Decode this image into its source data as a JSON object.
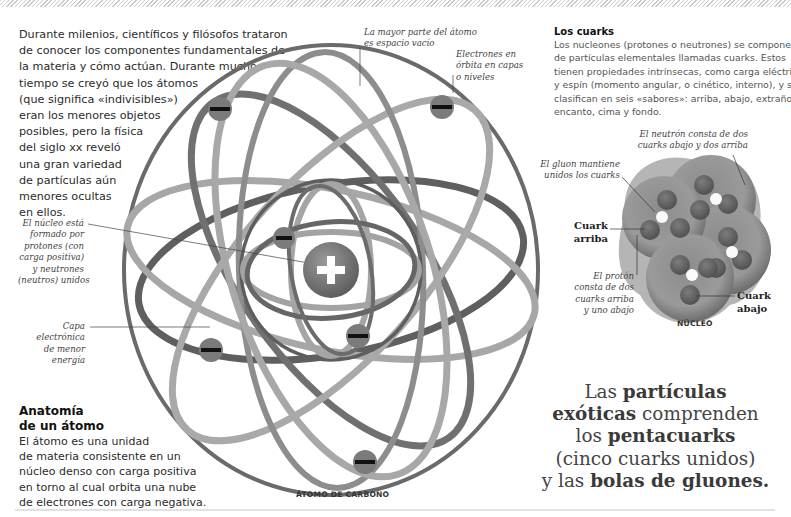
{
  "intro": {
    "lines": [
      "Durante milenios, científicos y filósofos trataron",
      "de conocer los componentes fundamentales de",
      "la materia y cómo actúan. Durante mucho",
      "tiempo se creyó que los átomos",
      "(que significa «indivisibles»)",
      "eran los menores objetos",
      "posibles, pero la física",
      "del siglo xx reveló",
      "una gran variedad",
      "de partículas aún",
      "menores ocultas",
      "en ellos."
    ]
  },
  "atom": {
    "caption": "ÁTOMO DE CARBONO",
    "nucleus_symbol": "+",
    "electron_symbol": "−",
    "annotations": {
      "nucleus": [
        "El núcleo está",
        "formado por",
        "protones (con",
        "carga positiva)",
        "y neutrones",
        "(neutros) unidos"
      ],
      "inner_shell": [
        "Capa",
        "electrónica",
        "de menor",
        "energía"
      ],
      "empty_space": [
        "La mayor parte del átomo",
        "es espacio vacío"
      ],
      "orbits": [
        "Electrones en",
        "órbita en capas",
        "o niveles"
      ]
    }
  },
  "anatomy": {
    "title_lines": [
      "Anatomía",
      "de un átomo"
    ],
    "body_lines": [
      "El átomo es una unidad",
      "de materia consistente en un",
      "núcleo denso con carga positiva",
      "en torno al cual orbita una nube",
      "de electrones con carga negativa."
    ]
  },
  "quarks": {
    "title": "Los cuarks",
    "body_lines": [
      "Los nucleones (protones o neutrones) se componen",
      "de partículas elementales llamadas cuarks. Estos",
      "tienen propiedades intrínsecas, como carga eléctrica",
      "y espín (momento angular, o cinético, interno), y se",
      "clasifican en seis «sabores»: arriba, abajo, extraño,",
      "encanto, cima y fondo."
    ],
    "nucleus_caption": "NÚCLEO",
    "annotations": {
      "neutron": [
        "El neutrón consta de dos",
        "cuarks abajo y dos arriba"
      ],
      "gluon": [
        "El gluon  mantiene",
        "unidos los cuarks"
      ],
      "proton": [
        "El protón",
        "consta de dos",
        "cuarks arriba",
        "y uno abajo"
      ]
    },
    "labels": {
      "up": [
        "Cuark",
        "arriba"
      ],
      "down": [
        "Cuark",
        "abajo"
      ]
    }
  },
  "exotic": {
    "line1_a": "Las ",
    "line1_b": "partículas",
    "line2_a": "exóticas",
    "line2_b": " comprenden",
    "line3_a": "los ",
    "line3_b": "pentacuarks",
    "line4": "(cinco cuarks unidos)",
    "line5_a": "y las ",
    "line5_b": "bolas de gluones."
  },
  "colors": {
    "orbit_dark": "#6d6d6d",
    "orbit_light": "#a3a3a3",
    "electron": "#7a7a7a",
    "nucleus": "#808080"
  }
}
